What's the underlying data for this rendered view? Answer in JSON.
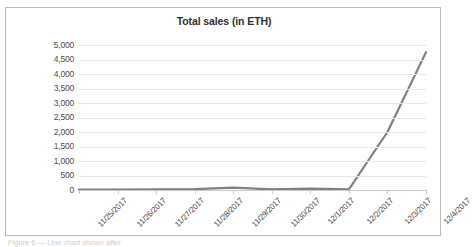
{
  "chart_data": {
    "type": "line",
    "title": "Total sales (in ETH)",
    "xlabel": "",
    "ylabel": "",
    "categories": [
      "11/25/2017",
      "11/26/2017",
      "11/27/2017",
      "11/28/2017",
      "11/29/2017",
      "11/30/2017",
      "12/1/2017",
      "12/2/2017",
      "12/3/2017",
      "12/4/2017"
    ],
    "series": [
      {
        "name": "Total sales (in ETH)",
        "values": [
          10,
          15,
          20,
          30,
          80,
          25,
          45,
          20,
          2000,
          4750
        ]
      }
    ],
    "ylim": [
      0,
      5000
    ],
    "ytick_values": [
      0,
      500,
      1000,
      1500,
      2000,
      2500,
      3000,
      3500,
      4000,
      4500,
      5000
    ],
    "ytick_labels": [
      "0",
      "500",
      "1,000",
      "1,500",
      "2,000",
      "2,500",
      "3,000",
      "3,500",
      "4,000",
      "4,500",
      "5,000"
    ],
    "grid": true,
    "legend": "none",
    "line_color": "#808080",
    "gridline_color": "#e8e8e8",
    "axis_color": "#c9c9c9",
    "border_color": "#b9b9b9",
    "background_color": "#ffffff"
  },
  "caption": {
    "ghost_text": "Figure 6 — Line chart shown after"
  }
}
